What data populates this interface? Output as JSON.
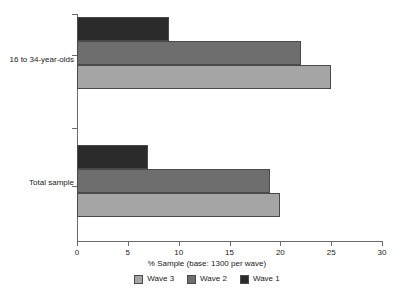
{
  "chart_data": {
    "type": "bar",
    "orientation": "horizontal",
    "title": "",
    "xlabel": "% Sample (base: 1300 per wave)",
    "ylabel": "",
    "categories": [
      "16 to 34-year-olds",
      "Total sample"
    ],
    "xticks": [
      0,
      5,
      10,
      15,
      20,
      25,
      30
    ],
    "xlim": [
      0,
      30
    ],
    "grid": false,
    "legend_position": "bottom",
    "series": [
      {
        "name": "Wave 3",
        "color": "#a5a5a5",
        "values": [
          25,
          20
        ]
      },
      {
        "name": "Wave 2",
        "color": "#6e6e6e",
        "values": [
          22,
          19
        ]
      },
      {
        "name": "Wave 1",
        "color": "#2b2b2b",
        "values": [
          9,
          7
        ]
      }
    ]
  },
  "axis": {
    "xlabel": "% Sample (base: 1300 per wave)",
    "ticks": [
      {
        "value": 0,
        "label": "0"
      },
      {
        "value": 5,
        "label": "5"
      },
      {
        "value": 10,
        "label": "10"
      },
      {
        "value": 15,
        "label": "15"
      },
      {
        "value": 20,
        "label": "20"
      },
      {
        "value": 25,
        "label": "25"
      },
      {
        "value": 30,
        "label": "30"
      }
    ]
  },
  "categories": [
    {
      "label": "16 to 34-year-olds"
    },
    {
      "label": "Total sample"
    }
  ],
  "legend": {
    "items": [
      {
        "label": "Wave 3",
        "color": "#a5a5a5"
      },
      {
        "label": "Wave 2",
        "color": "#6e6e6e"
      },
      {
        "label": "Wave 1",
        "color": "#2b2b2b"
      }
    ]
  },
  "colors": {
    "wave3": "#a5a5a5",
    "wave2": "#6e6e6e",
    "wave1": "#2b2b2b",
    "axis": "#6b6b6b",
    "bar_border": "#4a4a4a",
    "text": "#1a1a1a",
    "background": "#ffffff"
  }
}
